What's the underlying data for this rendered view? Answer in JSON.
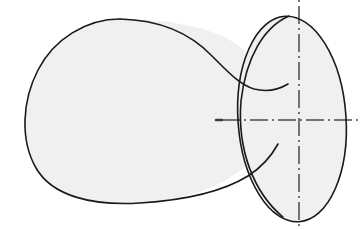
{
  "figure": {
    "type": "engineering-line-drawing",
    "canvas": {
      "width": 360,
      "height": 230,
      "background": "#ffffff"
    },
    "artifact_mark": "",
    "styles": {
      "outline_color": "#1a1a1a",
      "outline_width": 1.6,
      "fill_color": "#f0f0f0",
      "centerline_color": "#4a4a4a",
      "centerline_width": 1.5,
      "hidden_edge_color": "#1a1a1a"
    },
    "shapes": {
      "body_outline": {
        "name": "irregular-blob-body",
        "description": "Large gourd/peanut shaped body narrowing to a waist on the right",
        "path": "M 120 19 C 86 19 54 39 38 70 C 22 101 20 140 36 168 C 52 196 92 206 140 203 C 188 200 226 186 252 160 C 262 150 268 138 272 126 C 276 112 276 98 272 86 C 266 70 252 56 236 44 C 212 27 168 19 120 19 Z"
      },
      "waist_curve": {
        "name": "blob-waist-curve",
        "description": "Concave upper edge running from the dome down into the neck",
        "path": "M 120 19 C 160 20 190 34 210 54 C 226 70 238 84 252 88 C 262 91 272 90 282 86"
      },
      "lower_sweep": {
        "name": "blob-lower-sweep",
        "description": "Lower right edge leading into the boss",
        "path": "M 140 203 C 185 201 222 192 248 176 C 262 167 272 155 278 144"
      },
      "boss_ellipse": {
        "name": "cylindrical-boss",
        "description": "Elliptical boss / circular feature on the right side, slightly tilted",
        "cx": 292,
        "cy": 119,
        "rx": 54,
        "ry": 103,
        "rotation": -4
      },
      "boss_left_arc": {
        "name": "boss-left-arc",
        "description": "Visible left edge of the boss crossing the body",
        "path": "M 286 16 C 262 26 244 56 240 100 C 236 148 252 192 282 216"
      }
    },
    "centerlines": {
      "horizontal": {
        "name": "horizontal-centerline",
        "y": 120,
        "x_start": 216,
        "x_end": 360,
        "dash_pattern": "2,4,18,4"
      },
      "vertical": {
        "name": "vertical-centerline",
        "x": 299,
        "y_start": 0,
        "y_end": 230,
        "dash_pattern": "2,4,18,4"
      }
    }
  }
}
